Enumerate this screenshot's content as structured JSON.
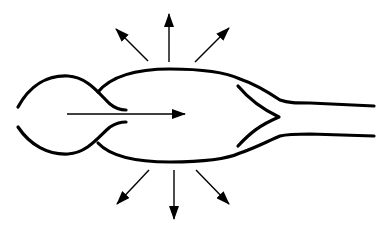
{
  "diagram": {
    "colors": {
      "stroke": "#000000",
      "background": "#ffffff"
    },
    "flow_arrow": {
      "from": [
        67,
        114
      ],
      "to": [
        185,
        114
      ]
    },
    "radial_arrows": [
      {
        "name": "top-left",
        "from": [
          148,
          61
        ],
        "to": [
          116,
          29
        ]
      },
      {
        "name": "top-center",
        "from": [
          169,
          62
        ],
        "to": [
          169,
          14
        ]
      },
      {
        "name": "top-right",
        "from": [
          195,
          62
        ],
        "to": [
          229,
          28
        ]
      },
      {
        "name": "bottom-left",
        "from": [
          149,
          170
        ],
        "to": [
          117,
          204
        ]
      },
      {
        "name": "bottom-center",
        "from": [
          174,
          170
        ],
        "to": [
          174,
          219
        ]
      },
      {
        "name": "bottom-right",
        "from": [
          196,
          170
        ],
        "to": [
          229,
          204
        ]
      }
    ],
    "labels": []
  }
}
